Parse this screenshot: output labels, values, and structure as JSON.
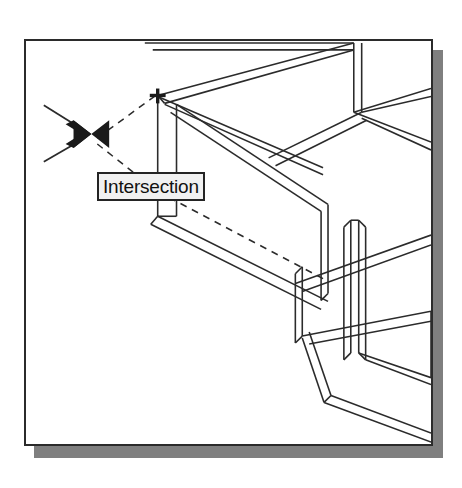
{
  "app": {
    "kind": "cad-drawing-viewport",
    "background_color": "#ffffff"
  },
  "panel": {
    "name": "drawing-panel",
    "x": 24,
    "y": 39,
    "width": 409,
    "height": 407,
    "border_color": "#2b2b2b",
    "fill_color": "#ffffff",
    "shadow_color": "#7f7f7f",
    "shadow_offset_x": 10,
    "shadow_offset_y": 11
  },
  "tooltip": {
    "label": "Intersection",
    "x": 95,
    "y": 170,
    "width": 117,
    "height": 29,
    "background_color": "#f1f1f1",
    "border_color": "#242424",
    "text_color": "#111111"
  },
  "markers": [
    {
      "name": "intersection-snap-marker",
      "glyph": "x-marker",
      "x": 88,
      "y": 133,
      "size": 30,
      "color": "#1a1a1a"
    },
    {
      "name": "endpoint-cross-marker",
      "glyph": "plus-marker",
      "x": 156,
      "y": 94,
      "size": 13,
      "color": "#1a1a1a"
    }
  ],
  "geometry": {
    "line_color": "#2b2b2b",
    "line_width": 1.6,
    "dashed_color": "#2b2b2b",
    "dash_pattern": "7 6",
    "description": "isometric wireframe of structural beams and vertical posts"
  },
  "statusbar": {
    "osnap_mode": "Intersection"
  }
}
